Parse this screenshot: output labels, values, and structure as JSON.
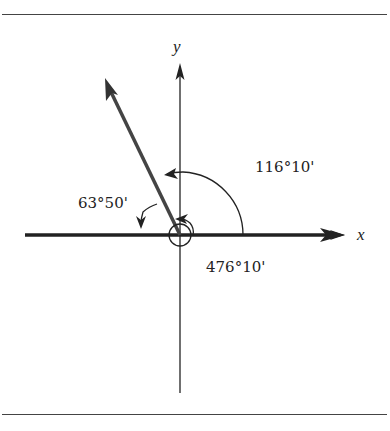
{
  "figure": {
    "axes": {
      "x_label": "x",
      "y_label": "y"
    },
    "angles": [
      {
        "id": "standard",
        "label": "116°10'",
        "description": "positive angle from +x axis to terminal side"
      },
      {
        "id": "reference",
        "label": "63°50'",
        "description": "angle from terminal side down to -x axis"
      },
      {
        "id": "coterminal",
        "label": "476°10'",
        "description": "coterminal angle: one full rotation plus 116°10'"
      }
    ],
    "colors": {
      "line": "#222222",
      "terminal_side": "#444444",
      "frame": "#444444"
    }
  }
}
